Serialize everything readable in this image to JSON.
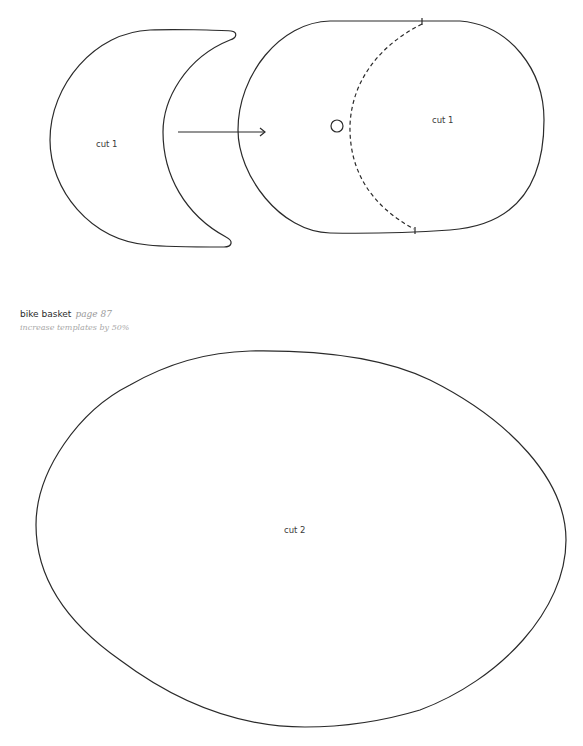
{
  "templates": {
    "crescent": {
      "label": "cut 1"
    },
    "side_panel": {
      "label": "cut 1"
    },
    "base": {
      "label": "cut 2"
    }
  },
  "caption": {
    "title": "bike basket",
    "page": "page 87",
    "note": "increase templates by 50%"
  },
  "colors": {
    "line": "#2a2a2a",
    "caption_muted": "#9a9a9a",
    "background": "#ffffff"
  }
}
